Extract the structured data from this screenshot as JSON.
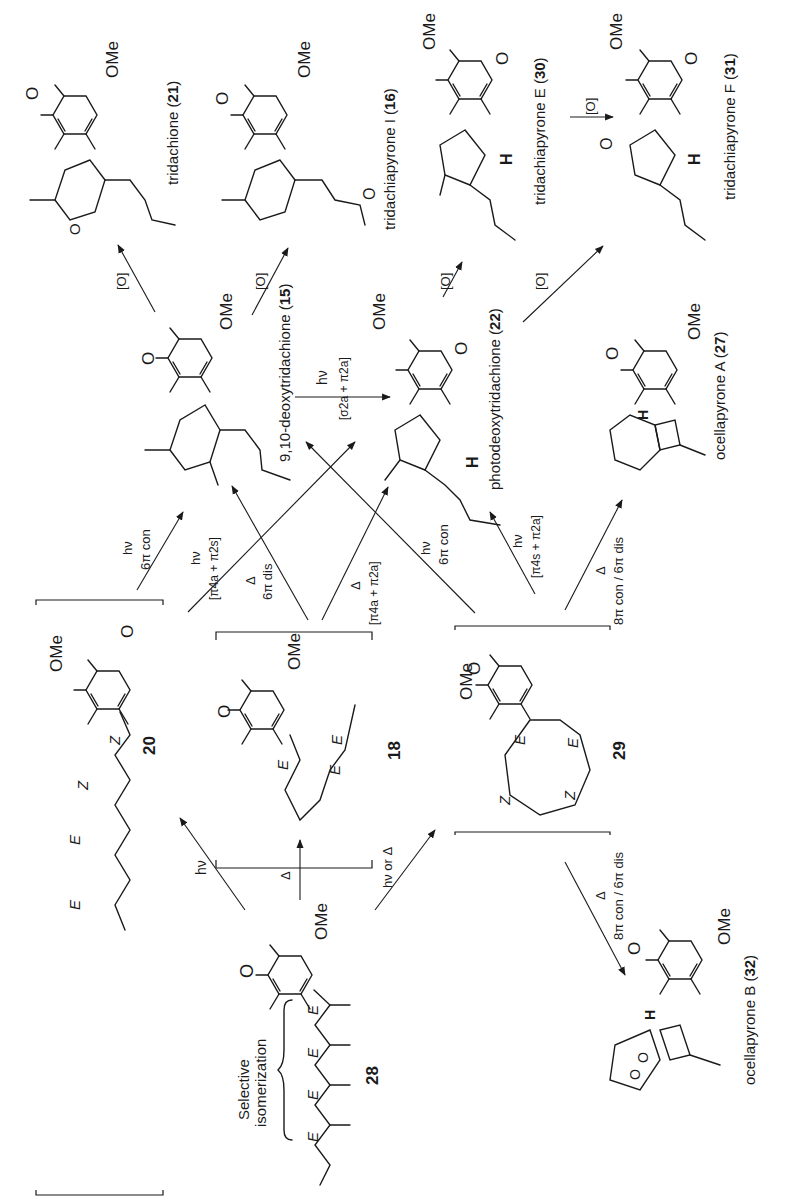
{
  "figure": {
    "orientation": "rotated 90 degrees counter-clockwise (text reads bottom-to-top)",
    "colors": {
      "ink": "#1a1a1a",
      "background": "#ffffff"
    }
  },
  "compounds": {
    "c28": {
      "number": "28",
      "name": "",
      "annotation": "Selective isomerization",
      "geometry": [
        "E",
        "E",
        "E",
        "E"
      ],
      "substituent": "OMe"
    },
    "c20": {
      "number": "20",
      "name": "",
      "geometry": [
        "E",
        "E",
        "Z",
        "Z"
      ],
      "substituent": "OMe",
      "bracketed": true
    },
    "c18": {
      "number": "18",
      "name": "",
      "geometry": [
        "E",
        "E",
        "E"
      ],
      "substituent": "OMe",
      "bracketed": true
    },
    "c29": {
      "number": "29",
      "name": "",
      "geometry": [
        "E",
        "Z",
        "Z",
        "E"
      ],
      "substituent": "OMe",
      "bracketed": true
    },
    "c15": {
      "number": "15",
      "name": "9,10-deoxytridachione",
      "substituent": "OMe"
    },
    "c21": {
      "number": "21",
      "name": "tridachione",
      "substituent": "OMe"
    },
    "c16": {
      "number": "16",
      "name": "tridachiapyrone I",
      "substituent": "OMe"
    },
    "c22": {
      "number": "22",
      "name": "photodeoxytridachione",
      "substituent": "OMe",
      "stereo_label": "H"
    },
    "c30": {
      "number": "30",
      "name": "tridachiapyrone E",
      "substituent": "OMe",
      "stereo_label": "H"
    },
    "c31": {
      "number": "31",
      "name": "tridachiapyrone F",
      "substituent": "OMe",
      "stereo_label": "H"
    },
    "c27": {
      "number": "27",
      "name": "ocellapyrone A",
      "substituent": "OMe",
      "stereo_label": "H"
    },
    "c32": {
      "number": "32",
      "name": "ocellapyrone B",
      "substituent": "OMe",
      "stereo_label": "H"
    }
  },
  "atom_labels": {
    "ome": "OMe",
    "o": "O",
    "h": "H",
    "e": "E",
    "z": "Z"
  },
  "arrows": [
    {
      "from": "28",
      "to": "20",
      "label": "hν"
    },
    {
      "from": "28",
      "to": "18",
      "label": "Δ"
    },
    {
      "from": "28",
      "to": "29",
      "label": "hν or Δ"
    },
    {
      "from": "20",
      "to": "15",
      "label": "hν",
      "sublabel": "6π con"
    },
    {
      "from": "20",
      "to": "22",
      "label": "hν",
      "sublabel": "[π4a + π2s]"
    },
    {
      "from": "18",
      "to": "15",
      "label": "Δ",
      "sublabel": "6π dis"
    },
    {
      "from": "18",
      "to": "22",
      "label": "Δ",
      "sublabel": "[π4a + π2a]"
    },
    {
      "from": "29",
      "to": "15",
      "label": "hν",
      "sublabel": "6π con"
    },
    {
      "from": "29",
      "to": "22",
      "label": "hν",
      "sublabel": "[π4s + π2a]"
    },
    {
      "from": "29",
      "to": "27",
      "label": "Δ",
      "sublabel": "8π con / 6π dis"
    },
    {
      "from": "29",
      "to": "32",
      "label": "Δ",
      "sublabel": "8π con / 6π dis"
    },
    {
      "from": "15",
      "to": "22",
      "label": "hν",
      "sublabel": "[σ2a + π2a]"
    },
    {
      "from": "15",
      "to": "21",
      "label": "[O]"
    },
    {
      "from": "15",
      "to": "16",
      "label": "[O]"
    },
    {
      "from": "22",
      "to": "30",
      "label": "[O]"
    },
    {
      "from": "22",
      "to": "31",
      "label": "[O]"
    },
    {
      "from": "30",
      "to": "31",
      "label": "[O]"
    }
  ],
  "text": {
    "hv": "hν",
    "heat": "Δ",
    "hv_or_heat": "hν or Δ",
    "ox": "[O]",
    "con6": "6π con",
    "dis6": "6π dis",
    "pi4a_pi2s": "[π4a + π2s]",
    "pi4a_pi2a": "[π4a + π2a]",
    "pi4s_pi2a": "[π4s + π2a]",
    "sig2a_pi2a": "[σ2a + π2a]",
    "con8_dis6": "8π con / 6π dis",
    "selective": "Selective",
    "isomerization": "isomerization"
  }
}
